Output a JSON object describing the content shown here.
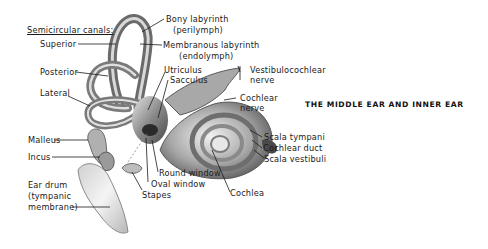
{
  "title": "THE MIDDLE EAR AND INNER EAR",
  "labels": {
    "semicircular_canals": "Semicircular canals:",
    "superior": "Superior",
    "posterior": "Posterior",
    "lateral": "Lateral",
    "bony_labyrinth": [
      "Bony labyrinth",
      "(perilymph)"
    ],
    "membranous_labyrinth": [
      "Membranous labyrinth",
      "(endolymph)"
    ],
    "utriculus": "Utriculus",
    "sacculus": "Sacculus",
    "vestibulocochlear_nerve": [
      "Vestibulocochlear",
      "nerve"
    ],
    "cochlear_nerve": [
      "Cochlear",
      "nerve"
    ],
    "scala_tympani": "Scala tympani",
    "cochlear_duct": "Cochlear duct",
    "scala_vestibuli": "Scala vestibuli",
    "cochlea": "Cochlea",
    "round_window": "Round window",
    "oval_window": "Oval window",
    "stapes": "Stapes",
    "malleus": "Malleus",
    "incus": "Incus",
    "ear_drum": [
      "Ear drum",
      "(tympanic",
      "membrane)"
    ]
  },
  "colors": {
    "text": "#1a1a1a",
    "illustration_dark": "#5a5a5a",
    "illustration_mid": "#9a9a9a",
    "illustration_light": "#dcdcdc"
  }
}
